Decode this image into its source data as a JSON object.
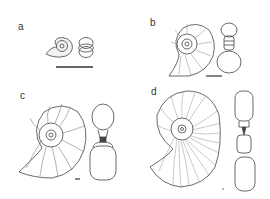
{
  "figure": {
    "panels": [
      {
        "id": "a",
        "label": "a",
        "views": [
          "lateral-view",
          "cross-section"
        ],
        "scale_bar": true
      },
      {
        "id": "b",
        "label": "b",
        "views": [
          "lateral-view",
          "cross-section"
        ],
        "scale_bar": true
      },
      {
        "id": "c",
        "label": "c",
        "views": [
          "lateral-view",
          "cross-section"
        ],
        "scale_bar": true
      },
      {
        "id": "d",
        "label": "d",
        "views": [
          "lateral-view",
          "cross-section"
        ],
        "scale_bar": true
      }
    ],
    "colors": {
      "line": "#444444",
      "stipple": "#9a9a9a",
      "background": "#ffffff"
    }
  }
}
